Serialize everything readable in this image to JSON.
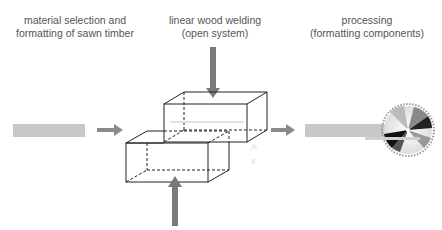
{
  "labels": {
    "step1": {
      "line1": "material selection and",
      "line2": "formatting of sawn timber"
    },
    "step2": {
      "line1": "linear wood welding",
      "line2": "(open system)"
    },
    "step3": {
      "line1": "processing",
      "line2": "(formatting components)"
    }
  },
  "icons": {
    "raw_timber": "timber-bar-icon",
    "arrow": "arrow-right-icon",
    "press_force": "force-arrow-icon",
    "blocks": "welded-blocks-icon",
    "product": "component-bar-icon",
    "saw": "circular-saw-icon"
  },
  "colors": {
    "bar": "#c8c8c8",
    "arrow": "#8a8a8a",
    "force": "#7a7a7a",
    "line": "#222222",
    "text": "#555555"
  }
}
